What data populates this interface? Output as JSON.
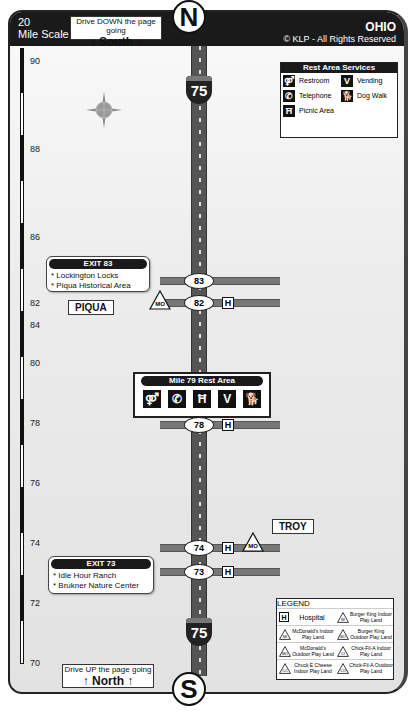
{
  "header": {
    "scale_label": "20\nMile Scale",
    "scale_number": "20",
    "scale_text": "Mile Scale",
    "drive_down": {
      "line1": "Drive DOWN the page going",
      "line2": "↓ South ↓"
    },
    "north_marker": "N",
    "state": "OHIO",
    "copyright": "© KLP - All Rights Reserved"
  },
  "footer": {
    "drive_up": {
      "line1": "Drive UP the page going",
      "line2": "↑ North ↑"
    },
    "south_marker": "S"
  },
  "highway": {
    "route_number": "75",
    "shield_top_label": "INTERSTATE"
  },
  "compass": {
    "n": "N",
    "s": "S",
    "e": "E",
    "w": "W"
  },
  "mile_scale": [
    "90",
    "88",
    "86",
    "84",
    "82",
    "80",
    "78",
    "76",
    "74",
    "72",
    "70"
  ],
  "rest_area_services": {
    "title": "Rest Area Services",
    "items": [
      {
        "icon": "restroom-icon",
        "label": "Restroom"
      },
      {
        "icon": "vending-icon",
        "label": "Vending"
      },
      {
        "icon": "telephone-icon",
        "label": "Telephone"
      },
      {
        "icon": "dog-walk-icon",
        "label": "Dog Walk"
      },
      {
        "icon": "picnic-icon",
        "label": "Picnic Area"
      }
    ]
  },
  "exits": [
    {
      "number": "83"
    },
    {
      "number": "82",
      "hospital": "H",
      "playland": "MO"
    },
    {
      "number": "78",
      "hospital": "H"
    },
    {
      "number": "74",
      "hospital": "H",
      "playland": "MO"
    },
    {
      "number": "73",
      "hospital": "H"
    }
  ],
  "exit_cards": [
    {
      "title": "EXIT 83",
      "items": [
        "* Lockington Locks",
        "* Piqua Historical Area"
      ]
    },
    {
      "title": "EXIT 73",
      "items": [
        "* Idle Hour Ranch",
        "* Brukner Nature Center"
      ]
    }
  ],
  "towns": [
    "PIQUA",
    "TROY"
  ],
  "rest_area": {
    "title": "Mile 79 Rest Area",
    "icons": [
      "restroom",
      "telephone",
      "picnic",
      "vending",
      "dog-walk"
    ]
  },
  "legend": {
    "title": "LEGEND",
    "items": [
      {
        "code": "H",
        "label": "Hospital"
      },
      {
        "code": "BI",
        "label": "Burger King Indoor Play Land"
      },
      {
        "code": "MI",
        "label": "McDonald's Indoor Play Land"
      },
      {
        "code": "BO",
        "label": "Burger King Outdoor Play Land"
      },
      {
        "code": "MO",
        "label": "McDonald's Outdoor Play Land"
      },
      {
        "code": "CI",
        "label": "Chick-Fil-A Indoor Play Land"
      },
      {
        "code": "CC",
        "label": "Chuck E Cheese Indoor Play Land"
      },
      {
        "code": "CO",
        "label": "Chick-Fil-A Outdoor Play Land"
      }
    ]
  }
}
